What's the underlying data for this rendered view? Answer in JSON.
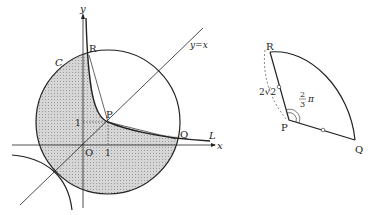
{
  "left_figure": {
    "axis_x_label": "x",
    "axis_y_label": "y",
    "origin_label": "O",
    "line_label": "y=x",
    "circle_label": "C",
    "curve_label": "L",
    "points": {
      "P": "P",
      "Q": "Q",
      "R": "R"
    },
    "tick_x": "1",
    "tick_y": "1"
  },
  "right_figure": {
    "points": {
      "P": "P",
      "Q": "Q",
      "R": "R"
    },
    "length_label": "2√2",
    "angle_numerator": "2",
    "angle_denominator": "3",
    "angle_suffix": "π"
  },
  "colors": {
    "stroke": "#222222",
    "shade": "#c8c8c8"
  }
}
